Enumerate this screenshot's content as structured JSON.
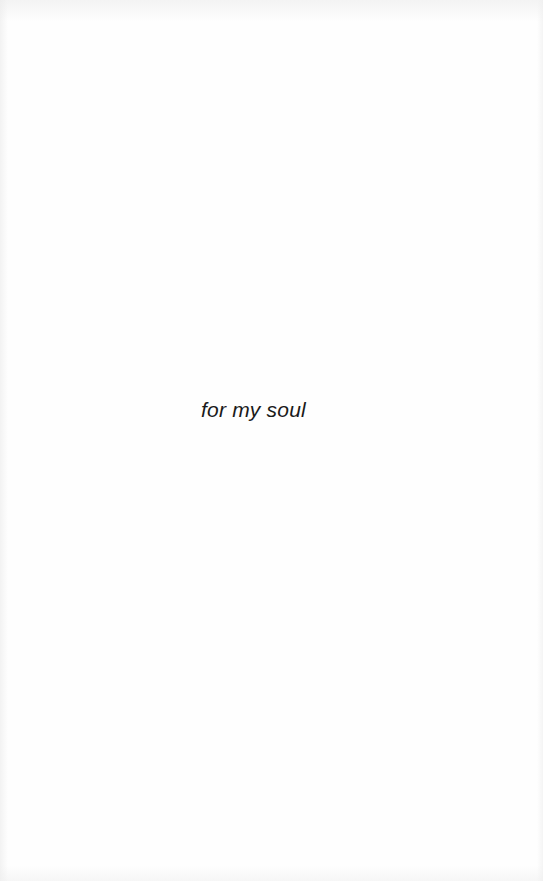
{
  "page": {
    "type": "dedication",
    "text": "for my soul"
  }
}
